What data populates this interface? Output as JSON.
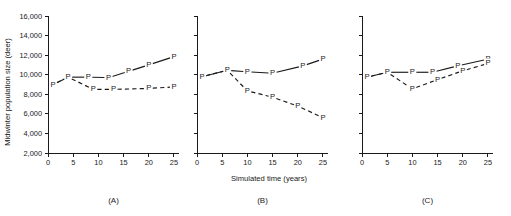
{
  "figure": {
    "y_axis_title": "Midwinter population size (deer)",
    "x_axis_title": "Simulated time (years)",
    "y_ticks": [
      "2,000",
      "4,000",
      "6,000",
      "8,000",
      "10,000",
      "12,000",
      "14,000",
      "16,000"
    ],
    "x_ticks": [
      "0",
      "5",
      "10",
      "15",
      "20",
      "25"
    ],
    "marker_glyph": "P",
    "line_color": "#1a1a1a"
  },
  "chart_data": [
    {
      "type": "line",
      "panel": "(A)",
      "title": "",
      "xlabel": "Simulated time (years)",
      "ylabel": "Midwinter population size (deer)",
      "xlim": [
        0,
        26
      ],
      "ylim": [
        2000,
        16000
      ],
      "xticks": [
        0,
        5,
        10,
        15,
        20,
        25
      ],
      "yticks": [
        2000,
        4000,
        6000,
        8000,
        10000,
        12000,
        14000,
        16000
      ],
      "grid": false,
      "legend": "none",
      "series": [
        {
          "name": "solid",
          "style": "solid",
          "marker": "P",
          "x": [
            1,
            4,
            8,
            12,
            16,
            20,
            25
          ],
          "values": [
            9000,
            9750,
            9750,
            9700,
            10350,
            11000,
            11850
          ]
        },
        {
          "name": "dashed",
          "style": "dashed",
          "marker": "P",
          "x": [
            1,
            4,
            9,
            13,
            20,
            25
          ],
          "values": [
            9000,
            9750,
            8500,
            8500,
            8600,
            8750
          ]
        }
      ]
    },
    {
      "type": "line",
      "panel": "(B)",
      "title": "",
      "xlabel": "Simulated time (years)",
      "ylabel": "Midwinter population size (deer)",
      "xlim": [
        0,
        26
      ],
      "ylim": [
        2000,
        16000
      ],
      "xticks": [
        0,
        5,
        10,
        15,
        20,
        25
      ],
      "yticks": [
        2000,
        4000,
        6000,
        8000,
        10000,
        12000,
        14000,
        16000
      ],
      "grid": false,
      "legend": "none",
      "series": [
        {
          "name": "solid",
          "style": "solid",
          "marker": "P",
          "x": [
            1,
            6,
            10,
            15,
            21,
            25
          ],
          "values": [
            9800,
            10450,
            10300,
            10150,
            10900,
            11600
          ]
        },
        {
          "name": "dashed",
          "style": "dashed",
          "marker": "P",
          "x": [
            1,
            6,
            10,
            15,
            20,
            25
          ],
          "values": [
            9800,
            10450,
            8350,
            7700,
            6800,
            5600
          ]
        }
      ]
    },
    {
      "type": "line",
      "panel": "(C)",
      "title": "",
      "xlabel": "Simulated time (years)",
      "ylabel": "Midwinter population size (deer)",
      "xlim": [
        0,
        26
      ],
      "ylim": [
        2000,
        16000
      ],
      "xticks": [
        0,
        5,
        10,
        15,
        20,
        25
      ],
      "yticks": [
        2000,
        4000,
        6000,
        8000,
        10000,
        12000,
        14000,
        16000
      ],
      "grid": false,
      "legend": "none",
      "series": [
        {
          "name": "solid",
          "style": "solid",
          "marker": "P",
          "x": [
            1,
            5,
            10,
            14,
            19,
            25
          ],
          "values": [
            9750,
            10250,
            10250,
            10250,
            10900,
            11600
          ]
        },
        {
          "name": "dashed",
          "style": "dashed",
          "marker": "P",
          "x": [
            1,
            5,
            10,
            15,
            20,
            25
          ],
          "values": [
            9750,
            10250,
            8550,
            9500,
            10400,
            11150
          ]
        }
      ]
    }
  ]
}
